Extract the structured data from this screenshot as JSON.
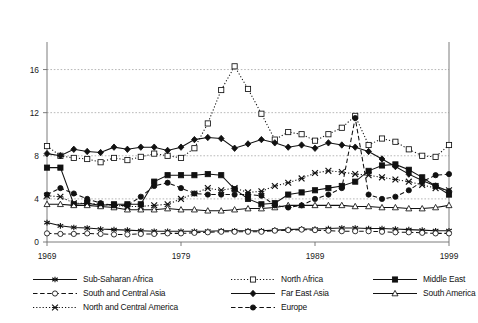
{
  "chart_data": {
    "type": "line",
    "title": "",
    "subtitle": "",
    "xlabel": "",
    "ylabel": "",
    "xlim": [
      1969,
      1999
    ],
    "ylim": [
      0,
      18
    ],
    "yticks": [
      0,
      4,
      8,
      12,
      16
    ],
    "xticks": [
      1969,
      1979,
      1989,
      1999
    ],
    "grid": true,
    "grid_axis": "y",
    "legend_position": "bottom",
    "legend_columns": 3,
    "x": [
      1969,
      1970,
      1971,
      1972,
      1973,
      1974,
      1975,
      1976,
      1977,
      1978,
      1979,
      1980,
      1981,
      1982,
      1983,
      1984,
      1985,
      1986,
      1987,
      1988,
      1989,
      1990,
      1991,
      1992,
      1993,
      1994,
      1995,
      1996,
      1997,
      1998,
      1999
    ],
    "series": [
      {
        "name": "Sub-Saharan Africa",
        "marker": "star",
        "line": "solid",
        "fill": "filled",
        "values": [
          1.8,
          1.5,
          1.35,
          1.3,
          1.2,
          1.15,
          1.1,
          1.05,
          1.0,
          1.0,
          1.0,
          1.0,
          1.0,
          1.05,
          1.05,
          1.05,
          1.05,
          1.1,
          1.15,
          1.2,
          1.2,
          1.25,
          1.3,
          1.3,
          1.25,
          1.25,
          1.2,
          1.15,
          1.1,
          1.05,
          1.05
        ]
      },
      {
        "name": "North Africa",
        "marker": "square",
        "line": "dotted",
        "fill": "open",
        "values": [
          8.9,
          8.0,
          7.8,
          7.7,
          7.4,
          7.8,
          7.6,
          7.9,
          8.2,
          8.0,
          7.8,
          8.7,
          11.0,
          14.1,
          16.3,
          14.2,
          11.9,
          9.5,
          10.2,
          10.0,
          9.4,
          10.0,
          10.6,
          11.7,
          9.0,
          9.6,
          9.3,
          8.6,
          8.0,
          7.9,
          9.0
        ]
      },
      {
        "name": "Middle East",
        "marker": "square",
        "line": "solid",
        "fill": "filled",
        "values": [
          6.9,
          6.9,
          3.5,
          3.6,
          3.4,
          3.5,
          3.5,
          3.5,
          5.6,
          6.2,
          6.2,
          6.2,
          6.3,
          6.2,
          4.9,
          4.0,
          3.5,
          3.6,
          4.4,
          4.6,
          4.8,
          5.0,
          5.2,
          5.6,
          6.6,
          7.1,
          7.2,
          6.7,
          6.0,
          5.2,
          4.4
        ]
      },
      {
        "name": "South and Central Asia",
        "marker": "circle",
        "line": "dashed",
        "fill": "open",
        "values": [
          0.8,
          0.75,
          0.75,
          0.8,
          0.75,
          0.7,
          0.7,
          0.75,
          0.75,
          0.8,
          0.8,
          0.85,
          0.9,
          0.95,
          0.95,
          0.95,
          0.95,
          1.05,
          1.1,
          1.15,
          1.1,
          1.05,
          1.0,
          1.0,
          1.0,
          0.95,
          0.9,
          0.9,
          0.85,
          0.8,
          0.8
        ]
      },
      {
        "name": "Far East Asia",
        "marker": "diamond",
        "line": "solid",
        "fill": "filled",
        "values": [
          8.2,
          8.0,
          8.6,
          8.4,
          8.3,
          8.8,
          8.6,
          8.8,
          8.8,
          8.5,
          8.8,
          9.5,
          9.7,
          9.6,
          8.7,
          9.1,
          9.5,
          9.2,
          8.8,
          9.0,
          8.7,
          9.2,
          9.0,
          8.8,
          8.4,
          7.7,
          7.0,
          6.3,
          5.7,
          5.2,
          4.7
        ]
      },
      {
        "name": "South America",
        "marker": "triangle",
        "line": "solid",
        "fill": "open",
        "values": [
          3.5,
          3.5,
          3.4,
          3.4,
          3.3,
          3.2,
          3.0,
          3.0,
          3.0,
          3.1,
          3.0,
          3.0,
          2.9,
          2.9,
          3.0,
          3.1,
          3.1,
          3.2,
          3.4,
          3.4,
          3.4,
          3.4,
          3.4,
          3.3,
          3.3,
          3.2,
          3.2,
          3.1,
          3.1,
          3.2,
          3.4
        ]
      },
      {
        "name": "North and Central America",
        "marker": "cross",
        "line": "dotted",
        "fill": "filled",
        "values": [
          4.3,
          4.2,
          3.6,
          3.6,
          3.5,
          3.4,
          3.3,
          3.3,
          3.4,
          3.5,
          4.0,
          4.5,
          5.0,
          4.8,
          5.0,
          4.6,
          4.7,
          5.2,
          5.5,
          5.9,
          6.4,
          6.6,
          6.5,
          6.3,
          6.2,
          6.0,
          5.8,
          5.6,
          5.3,
          5.0,
          4.8
        ]
      },
      {
        "name": "Europe",
        "marker": "circle",
        "line": "dashed",
        "fill": "filled",
        "values": [
          4.4,
          5.0,
          4.5,
          4.0,
          3.6,
          3.4,
          3.4,
          4.2,
          5.2,
          5.5,
          5.0,
          4.5,
          4.4,
          4.4,
          4.4,
          4.4,
          4.3,
          3.4,
          3.2,
          3.4,
          4.0,
          4.4,
          5.0,
          11.5,
          4.4,
          4.0,
          4.2,
          4.8,
          5.6,
          6.2,
          6.3
        ]
      }
    ]
  },
  "legend": {
    "entries": [
      {
        "label": "Sub-Saharan Africa"
      },
      {
        "label": "North Africa"
      },
      {
        "label": "Middle East"
      },
      {
        "label": "South and Central Asia"
      },
      {
        "label": "Far East Asia"
      },
      {
        "label": "South America"
      },
      {
        "label": "North and Central America"
      },
      {
        "label": "Europe"
      }
    ]
  },
  "axes": {
    "y_tick_labels": [
      "0",
      "4",
      "8",
      "12",
      "16"
    ],
    "x_tick_labels": [
      "1969",
      "1979",
      "1989",
      "1999"
    ]
  },
  "colors": {
    "line": "#111111",
    "grid": "#9a9a9a",
    "axis": "#6e6e6e",
    "background": "#ffffff"
  }
}
